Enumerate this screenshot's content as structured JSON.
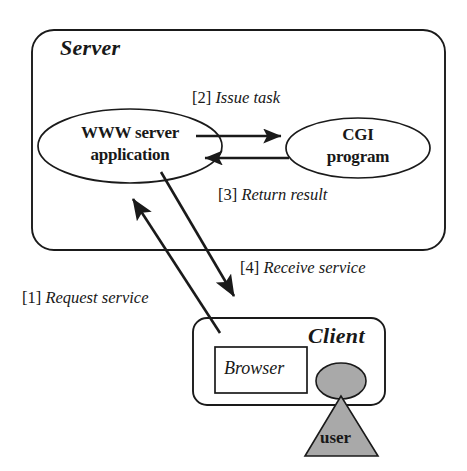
{
  "diagram": {
    "title_server": "Server",
    "title_client": "Client",
    "nodes": {
      "www_server": "WWW server\napplication",
      "www_server_line1": "WWW server",
      "www_server_line2": "application",
      "cgi": "CGI\nprogram",
      "cgi_line1": "CGI",
      "cgi_line2": "program",
      "browser": "Browser",
      "user": "user"
    },
    "steps": [
      {
        "tag": "[1]",
        "text": "Request service"
      },
      {
        "tag": "[2]",
        "text": "Issue task"
      },
      {
        "tag": "[3]",
        "text": "Return result"
      },
      {
        "tag": "[4]",
        "text": "Receive service"
      }
    ],
    "colors": {
      "stroke": "#1a1a1a",
      "text": "#181818",
      "figure_fill": "#a9a9a9",
      "background": "#ffffff"
    }
  }
}
